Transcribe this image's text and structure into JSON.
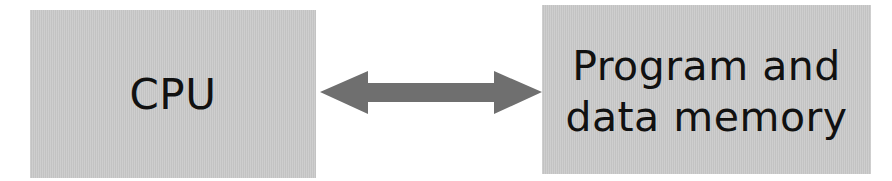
{
  "diagram": {
    "nodes": [
      {
        "id": "cpu",
        "label": "CPU"
      },
      {
        "id": "memory",
        "label_lines": [
          "Program and",
          "data memory"
        ]
      }
    ],
    "edges": [
      {
        "from": "cpu",
        "to": "memory",
        "direction": "bidirectional",
        "icon": "double-arrow-icon"
      }
    ],
    "colors": {
      "box_fill": "#c9c9c9",
      "arrow_fill": "#6f6f6f",
      "text": "#111111",
      "background": "#ffffff"
    }
  }
}
